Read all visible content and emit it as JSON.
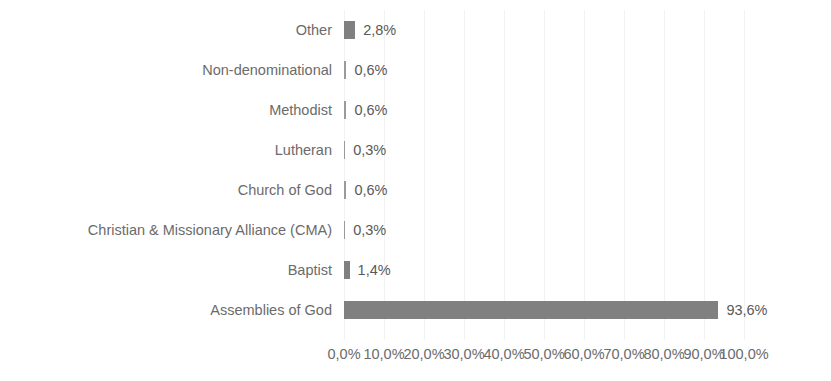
{
  "chart_data": {
    "type": "bar",
    "orientation": "horizontal",
    "title": "",
    "xlabel": "",
    "ylabel": "",
    "xlim": [
      0,
      100
    ],
    "grid": true,
    "legend": false,
    "bar_color": "#808080",
    "label_color": "#6b6b6b",
    "value_color": "#595959",
    "gridline_color": "#f2f2f2",
    "decimal_separator": ",",
    "categories": [
      "Other",
      "Non-denominational",
      "Methodist",
      "Lutheran",
      "Church of God",
      "Christian & Missionary Alliance (CMA)",
      "Baptist",
      "Assemblies of God"
    ],
    "values": [
      2.8,
      0.6,
      0.6,
      0.3,
      0.6,
      0.3,
      1.4,
      93.6
    ],
    "value_labels": [
      "2,8%",
      "0,6%",
      "0,6%",
      "0,3%",
      "0,6%",
      "0,3%",
      "1,4%",
      "93,6%"
    ],
    "xticks": [
      0,
      10,
      20,
      30,
      40,
      50,
      60,
      70,
      80,
      90,
      100
    ],
    "xticklabels": [
      "0,0%",
      "10,0%",
      "20,0%",
      "30,0%",
      "40,0%",
      "50,0%",
      "60,0%",
      "70,0%",
      "80,0%",
      "90,0%",
      "100,0%"
    ]
  }
}
